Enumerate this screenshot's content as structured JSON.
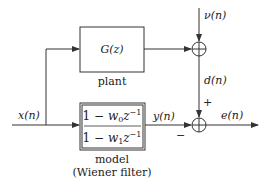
{
  "diagram": {
    "type": "block-diagram",
    "colors": {
      "stroke": "#333333",
      "text": "#222222",
      "background": "#ffffff"
    },
    "blocks": {
      "plant": {
        "transfer_function": "G(z)",
        "label": "plant"
      },
      "model": {
        "numerator": "1 − w₀z⁻¹",
        "denominator": "1 − w₁z⁻¹",
        "numerator_parts": {
          "lead": "1 − ",
          "w": "w",
          "sub": "0",
          "z": "z",
          "sup": "−1"
        },
        "denominator_parts": {
          "lead": "1 − ",
          "w": "w",
          "sub": "1",
          "z": "z",
          "sup": "−1"
        },
        "label_line1": "model",
        "label_line2": "(Wiener filter)"
      }
    },
    "signals": {
      "input": "x(n)",
      "noise": "ν(n)",
      "desired": "d(n)",
      "model_output": "y(n)",
      "error": "e(n)"
    },
    "summing_junctions": {
      "noise_sum": {
        "inputs": [
          "plant output",
          "ν(n)"
        ],
        "output": "d(n)"
      },
      "error_sum": {
        "plus_sign": "+",
        "minus_sign": "−",
        "inputs": [
          "d(n)",
          "y(n)"
        ],
        "output": "e(n)"
      }
    }
  }
}
